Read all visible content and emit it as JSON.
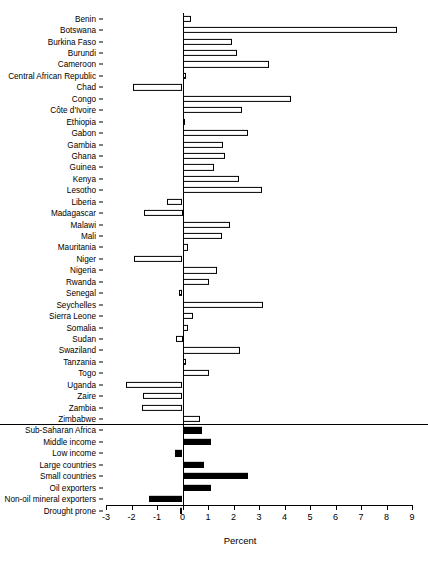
{
  "chart_data": {
    "type": "bar",
    "orientation": "horizontal",
    "title": "",
    "xlabel": "Percent",
    "ylabel": "",
    "xlim": [
      -3,
      9
    ],
    "xticks": [
      -3,
      -2,
      -1,
      0,
      1,
      2,
      3,
      4,
      5,
      6,
      7,
      8,
      9
    ],
    "xticklabels": [
      "-3",
      "-2",
      "-1",
      "0",
      "1",
      "2",
      "3",
      "4",
      "5",
      "6",
      "7",
      "8",
      "9"
    ],
    "grid": false,
    "legend": null,
    "zero_reference_line": true,
    "groups": [
      {
        "name": "countries",
        "fill": "hollow",
        "categories": [
          "Benin",
          "Botswana",
          "Burkina Faso",
          "Burundi",
          "Cameroon",
          "Central African Republic",
          "Chad",
          "Congo",
          "Côte d'Ivoire",
          "Ethiopia",
          "Gabon",
          "Gambia",
          "Ghana",
          "Guinea",
          "Kenya",
          "Lesotho",
          "Liberia",
          "Madagascar",
          "Malawi",
          "Mali",
          "Mauritania",
          "Niger",
          "Nigeria",
          "Rwanda",
          "Senegal",
          "Seychelles",
          "Sierra Leone",
          "Somalia",
          "Sudan",
          "Swaziland",
          "Tanzania",
          "Togo",
          "Uganda",
          "Zaire",
          "Zambia",
          "Zimbabwe"
        ],
        "values": [
          0.35,
          8.4,
          1.95,
          2.15,
          3.4,
          0.15,
          -1.95,
          4.25,
          2.35,
          0.05,
          2.55,
          1.6,
          1.65,
          1.25,
          2.2,
          3.1,
          -0.6,
          -1.5,
          1.85,
          1.55,
          0.2,
          -1.9,
          1.35,
          1.05,
          -0.15,
          3.15,
          0.4,
          0.2,
          -0.25,
          2.25,
          0.15,
          1.05,
          -2.2,
          -1.55,
          -1.6,
          0.7
        ]
      },
      {
        "name": "aggregates",
        "fill": "solid",
        "categories": [
          "Sub-Saharan Africa",
          "Middle income",
          "Low income",
          "Large countries",
          "Small countries",
          "Oil exporters",
          "Non-oil mineral exporters",
          "Drought prone"
        ],
        "values": [
          0.75,
          1.1,
          -0.3,
          0.85,
          2.55,
          1.1,
          -1.3,
          -0.1
        ]
      }
    ],
    "colors": {
      "bar_outline": "#000000",
      "bar_fill_hollow": "#ffffff",
      "bar_fill_solid": "#000000",
      "axis": "#000000",
      "background": "#ffffff"
    }
  }
}
